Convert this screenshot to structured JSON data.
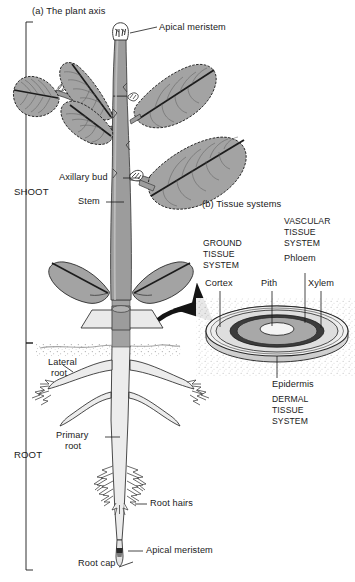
{
  "figure": {
    "panel_a": {
      "caption": "(a) The plant axis"
    },
    "panel_b": {
      "caption": "(b) Tissue systems"
    }
  },
  "brackets": [
    {
      "label": "SHOOT"
    },
    {
      "label": "ROOT"
    }
  ],
  "plant_labels": [
    {
      "text": "Apical meristem",
      "part": "shoot-apical-meristem"
    },
    {
      "text": "Axillary bud",
      "part": "axillary-bud"
    },
    {
      "text": "Stem",
      "part": "stem"
    },
    {
      "text": "Lateral\nroot",
      "part": "lateral-root"
    },
    {
      "text": "Primary\nroot",
      "part": "primary-root"
    },
    {
      "text": "Root hairs",
      "part": "root-hairs"
    },
    {
      "text": "Apical meristem",
      "part": "root-apical-meristem"
    },
    {
      "text": "Root cap",
      "part": "root-cap"
    }
  ],
  "plant_label_text": {
    "apical_meristem_shoot": "Apical meristem",
    "axillary_bud": "Axillary bud",
    "stem": "Stem",
    "lateral_root_line1": "Lateral",
    "lateral_root_line2": "root",
    "primary_root_line1": "Primary",
    "primary_root_line2": "root",
    "root_hairs": "Root hairs",
    "apical_meristem_root": "Apical meristem",
    "root_cap": "Root cap"
  },
  "tissue_systems": {
    "ground": {
      "line1": "GROUND",
      "line2": "TISSUE",
      "line3": "SYSTEM",
      "parts": [
        "Cortex",
        "Pith"
      ]
    },
    "vascular": {
      "line1": "VASCULAR",
      "line2": "TISSUE",
      "line3": "SYSTEM",
      "parts": [
        "Phloem",
        "Xylem"
      ]
    },
    "dermal": {
      "line1": "DERMAL",
      "line2": "TISSUE",
      "line3": "SYSTEM",
      "parts": [
        "Epidermis"
      ]
    },
    "cortex": "Cortex",
    "pith": "Pith",
    "phloem": "Phloem",
    "xylem": "Xylem",
    "epidermis": "Epidermis"
  },
  "colors": {
    "ink": "#1a1a1a",
    "stem_fill": "#9c9c9c",
    "leaf_fill": "#a3a3a3",
    "root_fill": "#e9e9e9",
    "disc_outer": "#efefef",
    "disc_cortex": "#e2e2e2",
    "disc_phloem": "#3c3c3c",
    "disc_xylem": "#a8a8a8",
    "disc_pith": "#f4f4f4",
    "soil": "#d8d8d8",
    "arrow": "#141414"
  }
}
